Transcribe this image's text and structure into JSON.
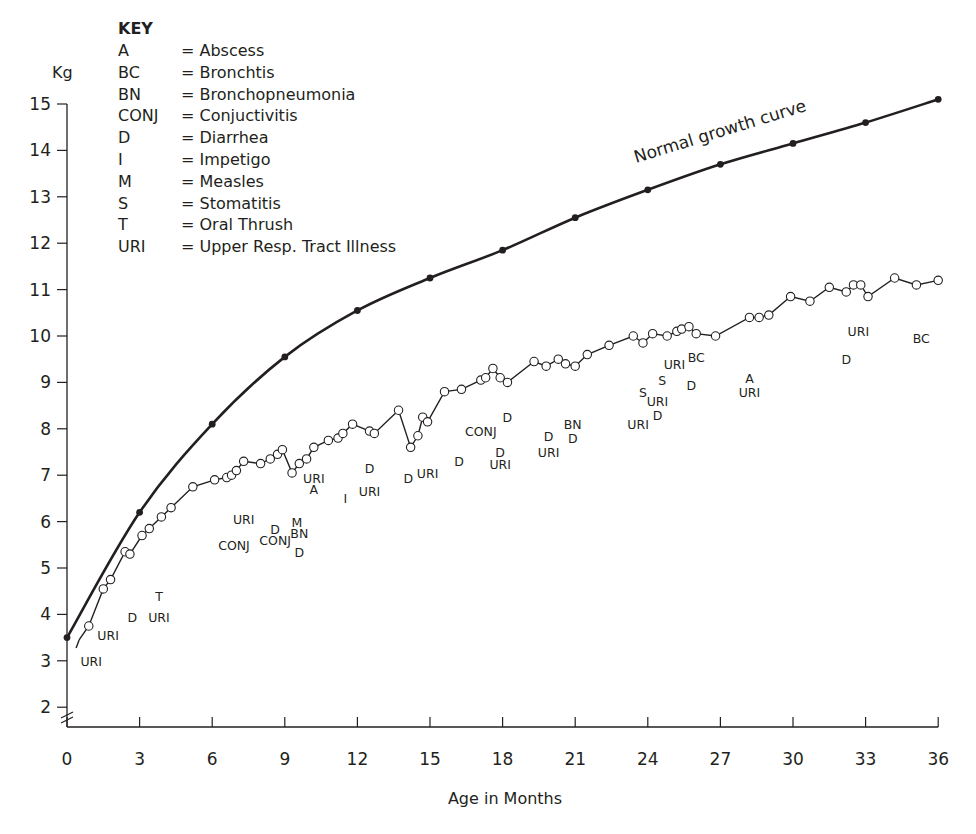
{
  "chart_data": {
    "type": "line",
    "title": "",
    "xlabel": "Age in Months",
    "ylabel": "Kg",
    "xlim": [
      0,
      36
    ],
    "ylim": [
      2,
      15
    ],
    "grid": false,
    "x_ticks": [
      0,
      3,
      6,
      9,
      12,
      15,
      18,
      21,
      24,
      27,
      30,
      33,
      36
    ],
    "y_ticks": [
      2,
      3,
      4,
      5,
      6,
      7,
      8,
      9,
      10,
      11,
      12,
      13,
      14,
      15
    ],
    "axis_break": "y-axis break marks between 0 and 2 kg",
    "series": [
      {
        "name": "Normal growth curve",
        "marker": "filled-circle",
        "x": [
          0,
          3,
          6,
          9,
          12,
          15,
          18,
          21,
          24,
          27,
          30,
          33,
          36
        ],
        "y": [
          3.5,
          6.2,
          8.1,
          9.55,
          10.55,
          11.25,
          11.85,
          12.55,
          13.15,
          13.7,
          14.15,
          14.6,
          15.1
        ]
      },
      {
        "name": "Observed child weight",
        "marker": "open-circle",
        "x": [
          0.5,
          0.9,
          1.5,
          1.8,
          2.4,
          2.6,
          3.1,
          3.4,
          3.9,
          4.3,
          5.2,
          6.1,
          6.6,
          6.8,
          7.0,
          7.3,
          8.0,
          8.4,
          8.7,
          8.9,
          9.3,
          9.6,
          9.9,
          10.2,
          10.8,
          11.2,
          11.4,
          11.8,
          12.5,
          12.7,
          13.7,
          14.2,
          14.5,
          14.7,
          14.9,
          15.6,
          16.3,
          17.1,
          17.3,
          17.6,
          17.9,
          18.2,
          19.3,
          19.8,
          20.3,
          20.6,
          21.0,
          21.5,
          22.4,
          23.4,
          23.8,
          24.2,
          24.8,
          25.2,
          25.4,
          25.7,
          26.0,
          26.8,
          28.2,
          28.6,
          29.0,
          29.9,
          30.7,
          31.5,
          32.2,
          32.5,
          32.8,
          33.1,
          34.2,
          35.1,
          36.0
        ],
        "y": [
          3.45,
          3.75,
          4.55,
          4.75,
          5.35,
          5.3,
          5.7,
          5.85,
          6.1,
          6.3,
          6.75,
          6.9,
          6.95,
          7.0,
          7.1,
          7.3,
          7.25,
          7.35,
          7.45,
          7.55,
          7.05,
          7.25,
          7.35,
          7.6,
          7.75,
          7.8,
          7.9,
          8.1,
          7.95,
          7.9,
          8.4,
          7.6,
          7.85,
          8.25,
          8.15,
          8.8,
          8.85,
          9.05,
          9.1,
          9.3,
          9.1,
          9.0,
          9.45,
          9.35,
          9.5,
          9.4,
          9.35,
          9.6,
          9.8,
          10.0,
          9.85,
          10.05,
          10.0,
          10.1,
          10.15,
          10.2,
          10.05,
          10.0,
          10.4,
          10.4,
          10.45,
          10.85,
          10.75,
          11.05,
          10.95,
          11.1,
          11.1,
          10.85,
          11.25,
          11.1,
          11.2
        ]
      }
    ],
    "annotations": [
      {
        "text": "URI",
        "x": 1.0,
        "y": 3.0
      },
      {
        "text": "URI",
        "x": 1.7,
        "y": 3.55
      },
      {
        "text": "D",
        "x": 2.7,
        "y": 3.95
      },
      {
        "text": "URI",
        "x": 3.8,
        "y": 3.95
      },
      {
        "text": "T",
        "x": 3.8,
        "y": 4.4
      },
      {
        "text": "URI",
        "x": 7.3,
        "y": 6.05
      },
      {
        "text": "CONJ",
        "x": 6.9,
        "y": 5.5
      },
      {
        "text": "D",
        "x": 8.6,
        "y": 5.85
      },
      {
        "text": "CONJ",
        "x": 8.6,
        "y": 5.6
      },
      {
        "text": "M",
        "x": 9.5,
        "y": 6.0
      },
      {
        "text": "BN",
        "x": 9.6,
        "y": 5.75
      },
      {
        "text": "D",
        "x": 9.6,
        "y": 5.35
      },
      {
        "text": "URI",
        "x": 10.2,
        "y": 6.95
      },
      {
        "text": "A",
        "x": 10.2,
        "y": 6.7
      },
      {
        "text": "I",
        "x": 11.5,
        "y": 6.5
      },
      {
        "text": "D",
        "x": 12.5,
        "y": 7.15
      },
      {
        "text": "URI",
        "x": 12.5,
        "y": 6.65
      },
      {
        "text": "D",
        "x": 14.1,
        "y": 6.95
      },
      {
        "text": "URI",
        "x": 14.9,
        "y": 7.05
      },
      {
        "text": "D",
        "x": 16.2,
        "y": 7.3
      },
      {
        "text": "CONJ",
        "x": 17.1,
        "y": 7.95
      },
      {
        "text": "D",
        "x": 18.2,
        "y": 8.25
      },
      {
        "text": "D",
        "x": 17.9,
        "y": 7.5
      },
      {
        "text": "URI",
        "x": 17.9,
        "y": 7.25
      },
      {
        "text": "D",
        "x": 19.9,
        "y": 7.85
      },
      {
        "text": "URI",
        "x": 19.9,
        "y": 7.5
      },
      {
        "text": "BN",
        "x": 20.9,
        "y": 8.1
      },
      {
        "text": "D",
        "x": 20.9,
        "y": 7.8
      },
      {
        "text": "URI",
        "x": 23.6,
        "y": 8.1
      },
      {
        "text": "S",
        "x": 23.8,
        "y": 8.8
      },
      {
        "text": "URI",
        "x": 24.4,
        "y": 8.6
      },
      {
        "text": "D",
        "x": 24.4,
        "y": 8.3
      },
      {
        "text": "S",
        "x": 24.6,
        "y": 9.05
      },
      {
        "text": "URI",
        "x": 25.1,
        "y": 9.4
      },
      {
        "text": "BC",
        "x": 26.0,
        "y": 9.55
      },
      {
        "text": "D",
        "x": 25.8,
        "y": 8.95
      },
      {
        "text": "A",
        "x": 28.2,
        "y": 9.1
      },
      {
        "text": "URI",
        "x": 28.2,
        "y": 8.8
      },
      {
        "text": "D",
        "x": 32.2,
        "y": 9.5
      },
      {
        "text": "URI",
        "x": 32.7,
        "y": 10.1
      },
      {
        "text": "BC",
        "x": 35.3,
        "y": 9.95
      }
    ],
    "curve_label": "Normal growth curve",
    "legend": {
      "title": "KEY",
      "position": "top-left",
      "entries": [
        {
          "code": "A",
          "meaning": "= Abscess"
        },
        {
          "code": "BC",
          "meaning": "= Bronchtis"
        },
        {
          "code": "BN",
          "meaning": "= Bronchopneumonia"
        },
        {
          "code": "CONJ",
          "meaning": "= Conjuctivitis"
        },
        {
          "code": "D",
          "meaning": "= Diarrhea"
        },
        {
          "code": "I",
          "meaning": "= Impetigo"
        },
        {
          "code": "M",
          "meaning": "= Measles"
        },
        {
          "code": "S",
          "meaning": "= Stomatitis"
        },
        {
          "code": "T",
          "meaning": "= Oral Thrush"
        },
        {
          "code": "URI",
          "meaning": "= Upper Resp. Tract Illness"
        }
      ]
    },
    "colors": {
      "line": "#231f20",
      "background": "#ffffff"
    }
  }
}
